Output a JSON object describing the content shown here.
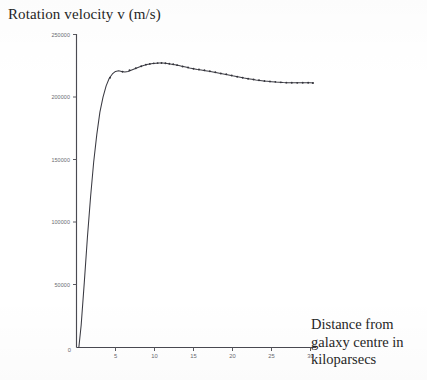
{
  "chart_data": {
    "type": "line",
    "title": "Rotation velocity v (m/s)",
    "xlabel": "Distance from galaxy centre in kiloparsecs",
    "ylabel": "Rotation velocity v (m/s)",
    "xlabel_lines": [
      "Distance from",
      "galaxy centre in",
      "kiloparsecs"
    ],
    "grid": false,
    "legend": "none",
    "xlim": [
      0,
      31
    ],
    "ylim": [
      0,
      250000
    ],
    "x_ticks": [
      0,
      5,
      10,
      15,
      20,
      25,
      30
    ],
    "x_tick_labels": [
      "0",
      "5",
      "10",
      "15",
      "20",
      "25",
      "30"
    ],
    "y_ticks": [
      0,
      50000,
      100000,
      150000,
      200000,
      250000
    ],
    "y_tick_labels": [
      "0",
      "50000",
      "100000",
      "150000",
      "200000",
      "250000"
    ],
    "series": [
      {
        "name": "Rotation velocity",
        "x": [
          0.3,
          0.6,
          1.0,
          1.4,
          1.8,
          2.2,
          2.6,
          3.0,
          3.4,
          3.8,
          4.2,
          4.6,
          5.0,
          5.4,
          5.8,
          6.2,
          6.6,
          7.0,
          7.4,
          7.8,
          8.2,
          8.6,
          9.0,
          9.4,
          9.8,
          10.2,
          10.6,
          11.0,
          11.4,
          11.8,
          12.2,
          12.6,
          13.0,
          13.5,
          14.0,
          14.5,
          15.0,
          15.5,
          16.0,
          16.5,
          17.0,
          17.5,
          18.0,
          18.5,
          19.0,
          19.5,
          20.0,
          20.5,
          21.0,
          21.5,
          22.0,
          22.5,
          23.0,
          23.5,
          24.0,
          24.5,
          25.0,
          25.5,
          26.0,
          26.5,
          27.0,
          27.5,
          28.0,
          28.5,
          29.0,
          29.5,
          30.0,
          30.4
        ],
        "y": [
          0,
          18000,
          52000,
          88000,
          120000,
          148000,
          170000,
          188000,
          200000,
          209000,
          215000,
          218500,
          220500,
          221000,
          220500,
          220000,
          220500,
          221500,
          222500,
          223500,
          224500,
          225300,
          226000,
          226500,
          226900,
          227100,
          227200,
          227200,
          227000,
          226700,
          226300,
          225900,
          225400,
          224700,
          224000,
          223300,
          222700,
          222100,
          221600,
          221100,
          220600,
          220100,
          219500,
          218900,
          218300,
          217700,
          217000,
          216400,
          215800,
          215200,
          214700,
          214200,
          213700,
          213300,
          212900,
          212600,
          212300,
          212000,
          211800,
          211600,
          211500,
          211400,
          211400,
          211400,
          211500,
          211500,
          211400,
          211200
        ]
      }
    ],
    "marker_points": {
      "x": [
        4.3,
        5.9,
        6.8,
        7.6,
        8.3,
        8.9,
        9.4,
        9.9,
        10.4,
        10.9,
        11.4,
        11.9,
        12.4,
        12.9,
        13.6,
        14.3,
        15.0,
        15.7,
        16.4,
        17.1,
        17.8,
        18.5,
        19.2,
        19.9,
        20.6,
        21.3,
        22.0,
        22.7,
        23.4,
        24.1,
        24.8,
        25.5,
        26.2,
        26.9,
        27.6,
        28.3,
        29.0,
        29.7,
        30.3
      ],
      "y": [
        215500,
        220200,
        221500,
        223000,
        224700,
        225900,
        226500,
        226950,
        227150,
        227200,
        227000,
        226650,
        226200,
        225500,
        224500,
        223700,
        222700,
        222000,
        221500,
        220600,
        219800,
        218900,
        218200,
        217200,
        216300,
        215500,
        214700,
        214100,
        213500,
        212900,
        212500,
        212200,
        211800,
        211550,
        211450,
        211400,
        211450,
        211450,
        211250
      ]
    }
  }
}
